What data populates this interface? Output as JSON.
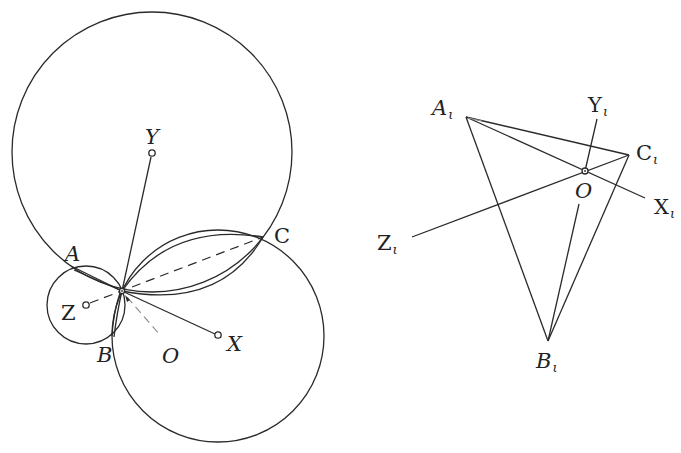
{
  "figure_left": {
    "labels": {
      "Y": "Y",
      "A": "A",
      "C": "C",
      "Z": "Z",
      "B": "B",
      "O": "O",
      "X": "X"
    },
    "circles": [
      {
        "name": "circle-Y",
        "cx": 152,
        "cy": 152,
        "r": 140
      },
      {
        "name": "circle-X",
        "cx": 218,
        "cy": 336,
        "r": 106
      },
      {
        "name": "circle-Z",
        "cx": 86,
        "cy": 305,
        "r": 39
      }
    ],
    "pivot": {
      "x": 122,
      "y": 291
    },
    "points": {
      "Y": {
        "x": 152,
        "y": 153
      },
      "X": {
        "x": 218,
        "y": 335
      },
      "Z": {
        "x": 86,
        "y": 305
      },
      "A": {
        "x": 71,
        "y": 266
      },
      "B": {
        "x": 114,
        "y": 337
      },
      "C": {
        "x": 263,
        "y": 237
      }
    }
  },
  "figure_right": {
    "labels": {
      "A": "A",
      "B": "B",
      "C": "C",
      "O": "O",
      "X": "X",
      "Y": "Y",
      "Z": "Z",
      "subscript": "ι"
    },
    "points": {
      "A1": {
        "x": 466,
        "y": 117
      },
      "B1": {
        "x": 548,
        "y": 341
      },
      "C1": {
        "x": 629,
        "y": 155
      },
      "O": {
        "x": 585,
        "y": 171
      },
      "Y1": {
        "x": 597,
        "y": 119
      },
      "X1": {
        "x": 645,
        "y": 198
      },
      "Z1": {
        "x": 412,
        "y": 237
      }
    }
  }
}
